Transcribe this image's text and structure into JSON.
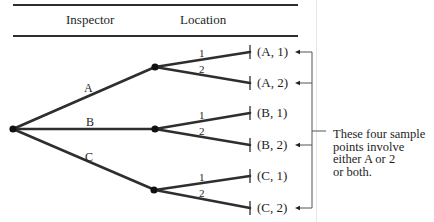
{
  "header": {
    "col1": "Inspector",
    "col2": "Location"
  },
  "tree": {
    "root": {
      "x": 13,
      "y": 129
    },
    "branches": [
      {
        "label": "A",
        "node": {
          "x": 155,
          "y": 67
        },
        "label_pos": {
          "x": 84,
          "y": 82
        }
      },
      {
        "label": "B",
        "node": {
          "x": 155,
          "y": 129
        },
        "label_pos": {
          "x": 86,
          "y": 117
        }
      },
      {
        "label": "C",
        "node": {
          "x": 155,
          "y": 190
        },
        "label_pos": {
          "x": 85,
          "y": 152
        }
      }
    ],
    "sub_branch_labels": [
      "1",
      "2"
    ],
    "leaves": [
      {
        "text": "(A, 1)",
        "y": 52,
        "arrow": true
      },
      {
        "text": "(A, 2)",
        "y": 83,
        "arrow": true
      },
      {
        "text": "(B, 1)",
        "y": 113,
        "arrow": false
      },
      {
        "text": "(B, 2)",
        "y": 145,
        "arrow": true
      },
      {
        "text": "(C, 1)",
        "y": 176,
        "arrow": false
      },
      {
        "text": "(C, 2)",
        "y": 208,
        "arrow": true
      }
    ]
  },
  "annotation": {
    "line1": "These four sample",
    "line2": "points involve",
    "line3": "either A or 2",
    "line4": "or both."
  },
  "colors": {
    "ink": "#2e2e2e",
    "page_edge": "#e6e6e6"
  }
}
